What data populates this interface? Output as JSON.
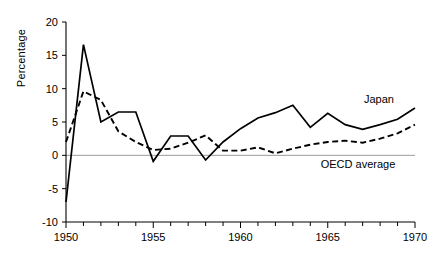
{
  "chart_data": {
    "type": "line",
    "title": "",
    "xlabel": "",
    "ylabel": "Percentage",
    "xlim": [
      1950,
      1970
    ],
    "ylim": [
      -10,
      20
    ],
    "yticks": [
      -10,
      -5,
      0,
      5,
      10,
      15,
      20
    ],
    "ytick_labels": [
      "-10",
      "-5",
      "0",
      "5",
      "10",
      "15",
      "20"
    ],
    "xticks": [
      1950,
      1955,
      1960,
      1965,
      1970
    ],
    "xtick_labels": [
      "1950",
      "1955",
      "1960",
      "1965",
      "1970"
    ],
    "minor_xticks_every": 1,
    "grid": false,
    "zero_reference_line": true,
    "legend_position": "inline-annotations",
    "x": [
      1950,
      1951,
      1952,
      1953,
      1954,
      1955,
      1956,
      1957,
      1958,
      1959,
      1960,
      1961,
      1962,
      1963,
      1964,
      1965,
      1966,
      1967,
      1968,
      1969,
      1970
    ],
    "series": [
      {
        "name": "Japan",
        "style": "solid",
        "annotation": "Japan",
        "values": [
          -7.0,
          16.6,
          5.0,
          6.5,
          6.5,
          -0.9,
          2.9,
          2.9,
          -0.7,
          2.0,
          4.0,
          5.6,
          6.4,
          7.5,
          4.2,
          6.3,
          4.6,
          3.9,
          4.6,
          5.4,
          7.1
        ]
      },
      {
        "name": "OECD average",
        "style": "dashed",
        "annotation": "OECD average",
        "values": [
          2.0,
          9.6,
          8.3,
          3.6,
          2.0,
          0.8,
          1.0,
          1.9,
          3.0,
          0.7,
          0.7,
          1.2,
          0.3,
          1.0,
          1.6,
          2.0,
          2.2,
          1.9,
          2.5,
          3.3,
          4.6
        ]
      }
    ],
    "colors": {
      "series": "#000000",
      "axis": "#000000",
      "zero_line": "#9a9a9a",
      "background": "#ffffff"
    }
  },
  "annotations": {
    "japan_label": "Japan",
    "oecd_label": "OECD average"
  }
}
